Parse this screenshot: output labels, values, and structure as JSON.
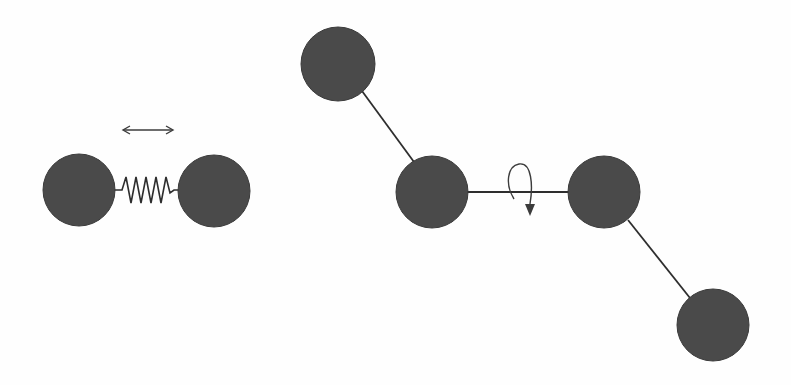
{
  "figure": {
    "colors": {
      "atom_fill": "#4a4a4a",
      "atom_edge": "#3a3a3a",
      "bond": "#2e2e2e",
      "arrow": "#3c3c3c",
      "background": "#fefefe"
    },
    "panels": [
      {
        "id": "stretch",
        "label": "bond-stretching",
        "atoms": 2,
        "connector": "spring",
        "motion_indicator": "double-headed-horizontal-arrow"
      },
      {
        "id": "torsion",
        "label": "torsional-rotation",
        "atoms": 4,
        "connector": "bond-line",
        "motion_indicator": "curved-rotation-arrow"
      }
    ]
  }
}
